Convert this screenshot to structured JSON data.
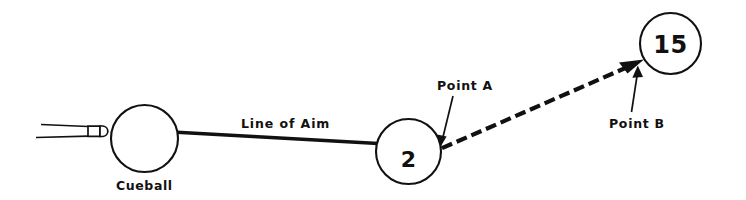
{
  "diagram": {
    "background_color": "#ffffff",
    "ink_color": "#111111",
    "width": 746,
    "height": 200
  },
  "labels": {
    "cueball": "Cueball",
    "line_of_aim": "Line of Aim",
    "point_a": "Point A",
    "point_b": "Point B"
  },
  "balls": {
    "cueball": {
      "label": "Cueball",
      "number": "",
      "cx": 144.5,
      "cy": 138.5,
      "r": 33.5
    },
    "object_ball": {
      "label": "2",
      "number": "2",
      "cx": 408.5,
      "cy": 151.5,
      "r": 32.5
    },
    "target_ball": {
      "label": "15",
      "number": "15",
      "cx": 670.5,
      "cy": 43.5,
      "r": 30.5
    }
  },
  "lines": {
    "aim_line": {
      "label": "Line of Aim",
      "style": "solid",
      "from_x": 177,
      "from_y": 132,
      "to_x": 440,
      "to_y": 147,
      "arrow": "end"
    },
    "deflection_line": {
      "label": "",
      "style": "dashed",
      "from_x": 442,
      "from_y": 148,
      "to_x": 643,
      "to_y": 60,
      "arrow": "end"
    }
  },
  "annotations": [
    {
      "name": "point-a",
      "text": "Point A",
      "text_x": 437,
      "text_y": 90,
      "leader_from_x": 452,
      "leader_from_y": 95,
      "leader_to_x": 441,
      "leader_to_y": 145
    },
    {
      "name": "point-b",
      "text": "Point B",
      "text_x": 609,
      "text_y": 128,
      "leader_from_x": 631,
      "leader_from_y": 113,
      "leader_to_x": 637,
      "leader_to_y": 66
    }
  ],
  "cue_stick": {
    "name": "cue-stick",
    "tip_x": 105,
    "tip_y": 133,
    "butt_x": 40,
    "butt_y": 136
  }
}
